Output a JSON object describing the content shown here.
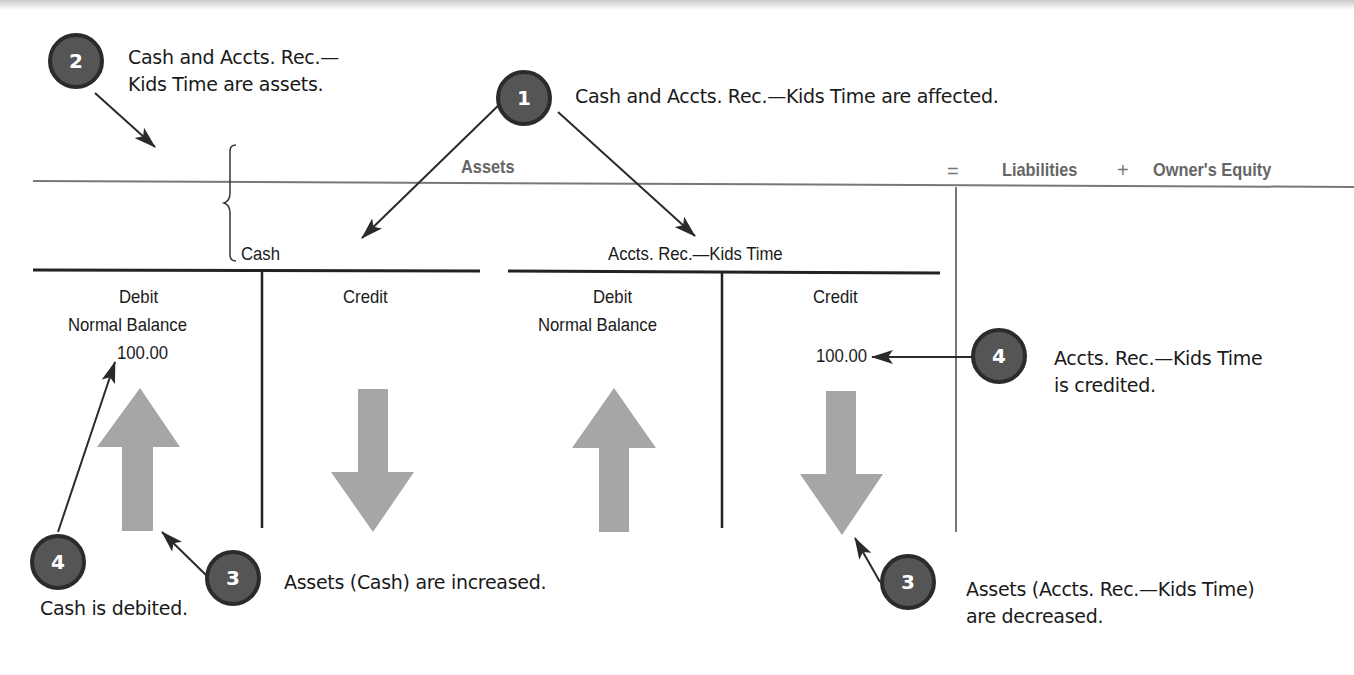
{
  "equation": {
    "assets": "Assets",
    "equals": "=",
    "liabilities": "Liabilities",
    "plus": "+",
    "owners_equity": "Owner's Equity"
  },
  "accounts": [
    {
      "name": "Cash",
      "debit_label": "Debit",
      "debit_sub": "Normal Balance",
      "credit_label": "Credit",
      "debit_value": "100.00",
      "credit_value": "",
      "debit_arrow": "up-arrow-icon",
      "credit_arrow": "down-arrow-icon"
    },
    {
      "name": "Accts. Rec.—Kids Time",
      "debit_label": "Debit",
      "debit_sub": "Normal Balance",
      "credit_label": "Credit",
      "debit_value": "",
      "credit_value": "100.00",
      "debit_arrow": "up-arrow-icon",
      "credit_arrow": "down-arrow-icon"
    }
  ],
  "callouts": [
    {
      "step": "1",
      "lines": [
        "Cash and Accts. Rec.—Kids Time are affected."
      ]
    },
    {
      "step": "2",
      "lines": [
        "Cash and Accts. Rec.—",
        "Kids Time are assets."
      ]
    },
    {
      "step": "3",
      "lines": [
        "Assets (Cash) are increased."
      ]
    },
    {
      "step": "4",
      "lines": [
        "Cash is debited."
      ]
    },
    {
      "step": "3",
      "lines": [
        "Assets (Accts. Rec.—Kids Time)",
        "are decreased."
      ]
    },
    {
      "step": "4",
      "lines": [
        "Accts. Rec.—Kids Time",
        "is credited."
      ]
    }
  ],
  "colors": {
    "badge_fill": "#555555",
    "badge_border": "#2b2b2b",
    "block_arrow": "#a6a6a6",
    "header_text": "#666666",
    "rule": "#777777"
  }
}
